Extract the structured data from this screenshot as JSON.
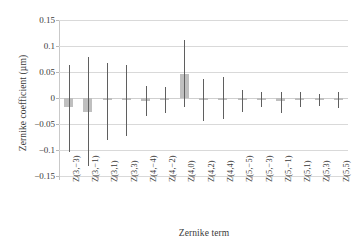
{
  "chart_data": {
    "type": "bar",
    "title": "",
    "xlabel": "Zernike term",
    "ylabel": "Zernike coefficient (µm)",
    "ylim": [
      -0.15,
      0.15
    ],
    "yticks": [
      0.15,
      0.1,
      0.05,
      0,
      -0.05,
      -0.1,
      -0.15
    ],
    "ytick_labels": [
      "0.15",
      "0.1",
      "0.05",
      "0",
      "−0.05",
      "−0.1",
      "−0.15"
    ],
    "grid": true,
    "legend": "none",
    "bar_color": "#bfbfbf",
    "errorbar_color": "#5f5f5f",
    "categories": [
      "Z(3,−3)",
      "Z(3,−1)",
      "Z(3,1)",
      "Z(3,3)",
      "Z(4,−4)",
      "Z(4,−2)",
      "Z(4,0)",
      "Z(4,2)",
      "Z(4,4)",
      "Z(5,−5)",
      "Z(5,−3)",
      "Z(5,−1)",
      "Z(5,1)",
      "Z(5,3)",
      "Z(5,5)"
    ],
    "values": [
      -0.018,
      -0.026,
      -0.004,
      -0.004,
      -0.005,
      -0.003,
      0.046,
      -0.003,
      -0.002,
      -0.002,
      -0.002,
      -0.005,
      -0.002,
      -0.001,
      -0.001
    ],
    "error_low": [
      -0.104,
      -0.13,
      -0.08,
      -0.074,
      -0.035,
      -0.029,
      -0.018,
      -0.044,
      -0.041,
      -0.026,
      -0.017,
      -0.029,
      -0.017,
      -0.016,
      -0.019
    ],
    "error_high": [
      0.063,
      0.079,
      0.068,
      0.063,
      0.024,
      0.021,
      0.112,
      0.036,
      0.04,
      0.015,
      0.012,
      0.012,
      0.012,
      0.008,
      0.011
    ]
  }
}
